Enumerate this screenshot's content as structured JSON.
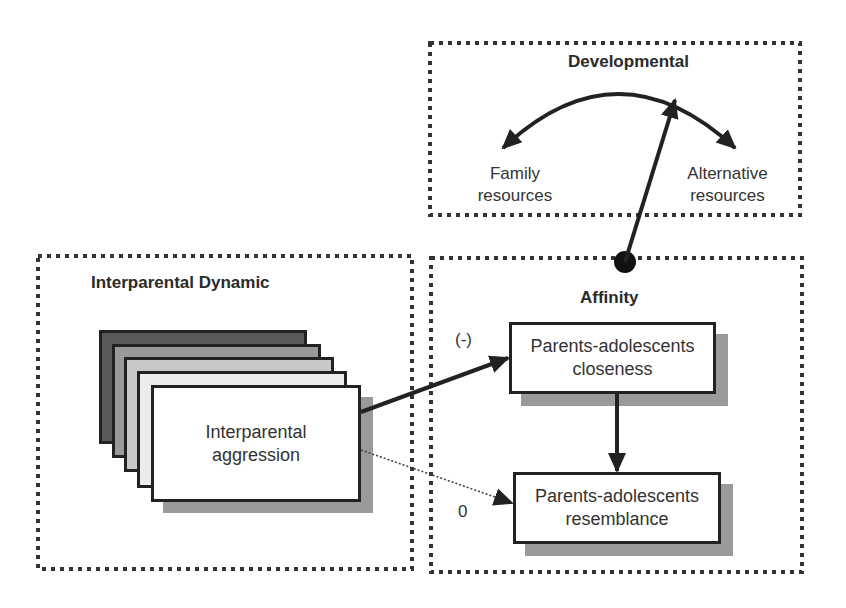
{
  "groups": {
    "developmental": {
      "title": "Developmental",
      "items": [
        {
          "line1": "Family",
          "line2": "resources"
        },
        {
          "line1": "Alternative",
          "line2": "resources"
        }
      ]
    },
    "interparental_dynamic": {
      "title": "Interparental Dynamic",
      "node": {
        "line1": "Interparental",
        "line2": "aggression"
      },
      "stack_colors": [
        "#5a5a5a",
        "#9a9a9a",
        "#c8c8c8",
        "#ececec",
        "#ffffff"
      ]
    },
    "affinity": {
      "title": "Affinity",
      "nodes": [
        {
          "line1": "Parents-adolescents",
          "line2": "closeness"
        },
        {
          "line1": "Parents-adolescents",
          "line2": "resemblance"
        }
      ]
    }
  },
  "edges": [
    {
      "from": "Interparental aggression",
      "to": "Parents-adolescents closeness",
      "label": "(-)",
      "style": "solid"
    },
    {
      "from": "Interparental aggression",
      "to": "Parents-adolescents resemblance",
      "label": "0",
      "style": "dotted"
    },
    {
      "from": "Parents-adolescents closeness",
      "to": "Parents-adolescents resemblance",
      "label": "",
      "style": "solid"
    },
    {
      "from": "Affinity",
      "to": "Developmental",
      "label": "",
      "style": "solid"
    },
    {
      "from": "Developmental",
      "to": "Family resources / Alternative resources",
      "label": "",
      "style": "bidirectional-arc"
    }
  ],
  "colors": {
    "line": "#222222",
    "shadow": "#9a9a9a",
    "text": "#333333"
  }
}
